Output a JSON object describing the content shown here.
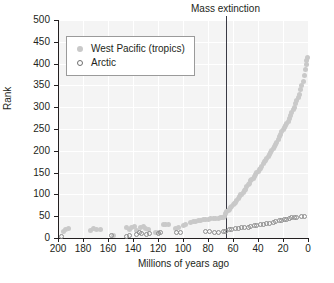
{
  "chart_data": {
    "type": "scatter",
    "title": "",
    "xlabel": "Millions of years ago",
    "ylabel": "Rank",
    "xlim": [
      200,
      0
    ],
    "ylim": [
      0,
      500
    ],
    "x_reversed": true,
    "xticks": [
      200,
      180,
      160,
      140,
      120,
      100,
      80,
      60,
      40,
      20,
      0
    ],
    "yticks": [
      0,
      50,
      100,
      150,
      200,
      250,
      300,
      350,
      400,
      450,
      500
    ],
    "grid": "faint-white",
    "legend_position": "top-left",
    "annotations": [
      {
        "label": "Mass extinction",
        "x": 66,
        "type": "vline"
      }
    ],
    "series": [
      {
        "name": "West Pacific (tropics)",
        "marker": "filled-circle",
        "color": "#c9c9c9",
        "points": [
          [
            196,
            14
          ],
          [
            194,
            20
          ],
          [
            192,
            21
          ],
          [
            174,
            18
          ],
          [
            172,
            21
          ],
          [
            169,
            20
          ],
          [
            166,
            20
          ],
          [
            156,
            6
          ],
          [
            145,
            24
          ],
          [
            143,
            20
          ],
          [
            141,
            25
          ],
          [
            139,
            26
          ],
          [
            137,
            18
          ],
          [
            134,
            25
          ],
          [
            132,
            26
          ],
          [
            130,
            21
          ],
          [
            128,
            20
          ],
          [
            122,
            13
          ],
          [
            120,
            12
          ],
          [
            116,
            30
          ],
          [
            114,
            32
          ],
          [
            112,
            31
          ],
          [
            106,
            22
          ],
          [
            104,
            23
          ],
          [
            100,
            28
          ],
          [
            98,
            30
          ],
          [
            94,
            36
          ],
          [
            92,
            37
          ],
          [
            90,
            38
          ],
          [
            88,
            40
          ],
          [
            86,
            41
          ],
          [
            84,
            42
          ],
          [
            82,
            43
          ],
          [
            80,
            43
          ],
          [
            78,
            44
          ],
          [
            76,
            45
          ],
          [
            74,
            44
          ],
          [
            72,
            45
          ],
          [
            70,
            46
          ],
          [
            69,
            47
          ],
          [
            68,
            48
          ],
          [
            67,
            50
          ],
          [
            66,
            56
          ],
          [
            65,
            60
          ],
          [
            64,
            62
          ],
          [
            63,
            66
          ],
          [
            62,
            70
          ],
          [
            61,
            72
          ],
          [
            60,
            76
          ],
          [
            59,
            80
          ],
          [
            58,
            82
          ],
          [
            57,
            86
          ],
          [
            56,
            90
          ],
          [
            55,
            95
          ],
          [
            54,
            99
          ],
          [
            53,
            100
          ],
          [
            52,
            104
          ],
          [
            51,
            108
          ],
          [
            50,
            112
          ],
          [
            49,
            118
          ],
          [
            48,
            122
          ],
          [
            47,
            126
          ],
          [
            46,
            131
          ],
          [
            45,
            134
          ],
          [
            44,
            136
          ],
          [
            43,
            140
          ],
          [
            42,
            145
          ],
          [
            41,
            150
          ],
          [
            40,
            152
          ],
          [
            39,
            156
          ],
          [
            38,
            160
          ],
          [
            37,
            164
          ],
          [
            36,
            170
          ],
          [
            35,
            175
          ],
          [
            34,
            178
          ],
          [
            33,
            182
          ],
          [
            32,
            188
          ],
          [
            31,
            192
          ],
          [
            30,
            196
          ],
          [
            29,
            200
          ],
          [
            28,
            206
          ],
          [
            27,
            210
          ],
          [
            26,
            215
          ],
          [
            25,
            220
          ],
          [
            24,
            226
          ],
          [
            23,
            232
          ],
          [
            22,
            238
          ],
          [
            21,
            244
          ],
          [
            20,
            250
          ],
          [
            19,
            254
          ],
          [
            18,
            258
          ],
          [
            17,
            262
          ],
          [
            16,
            268
          ],
          [
            15,
            275
          ],
          [
            14,
            282
          ],
          [
            13,
            288
          ],
          [
            12,
            294
          ],
          [
            11,
            300
          ],
          [
            10,
            308
          ],
          [
            9,
            315
          ],
          [
            8,
            322
          ],
          [
            7,
            330
          ],
          [
            6,
            340
          ],
          [
            5,
            350
          ],
          [
            4,
            360
          ],
          [
            3,
            372
          ],
          [
            2,
            386
          ],
          [
            1.5,
            398
          ],
          [
            1,
            406
          ],
          [
            0.5,
            415
          ]
        ]
      },
      {
        "name": "Arctic",
        "marker": "open-circle",
        "color": "#8d8d8d",
        "points": [
          [
            197,
            3
          ],
          [
            157,
            5
          ],
          [
            145,
            4
          ],
          [
            143,
            6
          ],
          [
            137,
            9
          ],
          [
            135,
            12
          ],
          [
            133,
            11
          ],
          [
            129,
            9
          ],
          [
            127,
            10
          ],
          [
            120,
            10
          ],
          [
            118,
            12
          ],
          [
            105,
            13
          ],
          [
            102,
            13
          ],
          [
            82,
            14
          ],
          [
            79,
            14
          ],
          [
            75,
            12
          ],
          [
            72,
            13
          ],
          [
            68,
            14
          ],
          [
            66,
            16
          ],
          [
            63,
            19
          ],
          [
            61,
            20
          ],
          [
            58,
            21
          ],
          [
            56,
            22
          ],
          [
            53,
            23
          ],
          [
            51,
            24
          ],
          [
            48,
            25
          ],
          [
            46,
            26
          ],
          [
            43,
            28
          ],
          [
            41,
            29
          ],
          [
            38,
            30
          ],
          [
            36,
            31
          ],
          [
            33,
            33
          ],
          [
            31,
            34
          ],
          [
            28,
            36
          ],
          [
            26,
            37
          ],
          [
            23,
            39
          ],
          [
            21,
            40
          ],
          [
            19,
            42
          ],
          [
            17,
            43
          ],
          [
            15,
            45
          ],
          [
            13,
            46
          ],
          [
            11,
            47
          ],
          [
            9,
            48
          ],
          [
            5,
            50
          ],
          [
            3,
            49
          ]
        ]
      }
    ]
  },
  "legend": {
    "items": [
      {
        "label": "West Pacific (tropics)",
        "marker": "filled-circle"
      },
      {
        "label": "Arctic",
        "marker": "open-circle"
      }
    ]
  }
}
